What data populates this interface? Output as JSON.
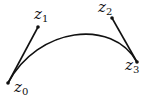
{
  "diagram": {
    "type": "bezier-curve",
    "colors": {
      "stroke": "#111111",
      "background": "#ffffff"
    },
    "points": [
      {
        "name": "z0",
        "base": "z",
        "sub": "0",
        "x": 8,
        "y": 83
      },
      {
        "name": "z1",
        "base": "z",
        "sub": "1",
        "x": 38,
        "y": 27
      },
      {
        "name": "z2",
        "base": "z",
        "sub": "2",
        "x": 112,
        "y": 18
      },
      {
        "name": "z3",
        "base": "z",
        "sub": "3",
        "x": 137,
        "y": 62
      }
    ]
  }
}
